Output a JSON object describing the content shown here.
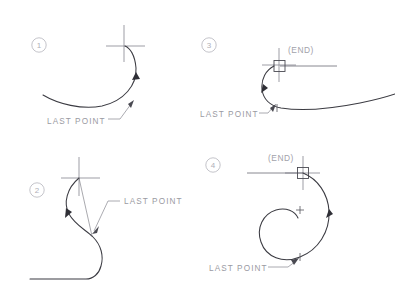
{
  "document": {
    "title": "Spline continuation reference diagram",
    "background_color": "#ffffff",
    "width": 395,
    "height": 295
  },
  "style": {
    "curve_color": "#3b3b42",
    "label_color": "#9a9aa2",
    "marker_color": "#b9b9c0",
    "crosshair_color": "#8d8d96",
    "snapbox_color": "#4a4a52"
  },
  "panels": [
    {
      "id": "panel-1",
      "number": "1",
      "annotations": {
        "last_point": "LAST  POINT"
      },
      "has_end_snap": false,
      "has_chord": false,
      "shape": "open-hook-curve"
    },
    {
      "id": "panel-2",
      "number": "2",
      "annotations": {
        "last_point": "LAST  POINT"
      },
      "has_end_snap": false,
      "has_chord": true,
      "shape": "s-curve-to-horizontal"
    },
    {
      "id": "panel-3",
      "number": "3",
      "annotations": {
        "last_point": "LAST  POINT",
        "end_snap": "(END)"
      },
      "has_end_snap": true,
      "has_chord": false,
      "shape": "hook-curve-with-tail"
    },
    {
      "id": "panel-4",
      "number": "4",
      "annotations": {
        "last_point": "LAST  POINT",
        "end_snap": "(END)"
      },
      "has_end_snap": true,
      "has_chord": false,
      "shape": "spiral"
    }
  ]
}
